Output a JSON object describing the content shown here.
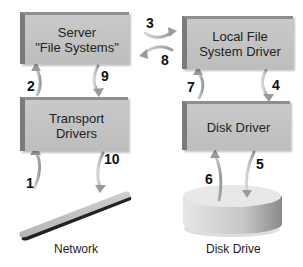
{
  "diagram": {
    "nodes": {
      "server": {
        "line1": "Server",
        "line2": "\"File Systems\""
      },
      "transport": {
        "line1": "Transport",
        "line2": "Drivers"
      },
      "local_fs": {
        "line1": "Local File",
        "line2": "System Driver"
      },
      "disk_driver": {
        "line1": "Disk Driver"
      },
      "network": {
        "label": "Network"
      },
      "disk_drive": {
        "label": "Disk Drive"
      }
    },
    "steps": {
      "s1": "1",
      "s2": "2",
      "s3": "3",
      "s4": "4",
      "s5": "5",
      "s6": "6",
      "s7": "7",
      "s8": "8",
      "s9": "9",
      "s10": "10"
    },
    "edges": [
      {
        "step": "1",
        "from": "Network",
        "to": "Transport Drivers"
      },
      {
        "step": "2",
        "from": "Transport Drivers",
        "to": "Server \"File Systems\""
      },
      {
        "step": "3",
        "from": "Server \"File Systems\"",
        "to": "Local File System Driver"
      },
      {
        "step": "4",
        "from": "Local File System Driver",
        "to": "Disk Driver"
      },
      {
        "step": "5",
        "from": "Disk Driver",
        "to": "Disk Drive"
      },
      {
        "step": "6",
        "from": "Disk Drive",
        "to": "Disk Driver"
      },
      {
        "step": "7",
        "from": "Disk Driver",
        "to": "Local File System Driver"
      },
      {
        "step": "8",
        "from": "Local File System Driver",
        "to": "Server \"File Systems\""
      },
      {
        "step": "9",
        "from": "Server \"File Systems\"",
        "to": "Transport Drivers"
      },
      {
        "step": "10",
        "from": "Transport Drivers",
        "to": "Network"
      }
    ],
    "colors": {
      "box": "#c4c4c4",
      "box_edge": "#7a7a7a",
      "arrow": "#a8a8a8",
      "text": "#222222"
    }
  }
}
